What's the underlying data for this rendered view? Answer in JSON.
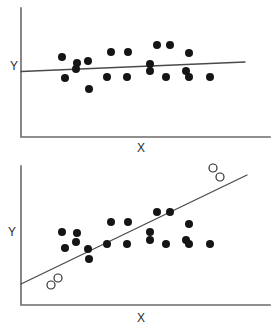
{
  "figure": {
    "background_color": "#ffffff",
    "width": 274,
    "height": 330,
    "point_fill_color": "#151515",
    "point_open_color": "#ffffff",
    "point_outline_color": "#303030",
    "line_color": "#4a4a4a",
    "axis_color": "#6b6b6b"
  },
  "panels": [
    {
      "name": "top-panel",
      "xlabel": "X",
      "ylabel": "Y",
      "axis": {
        "x0": 21,
        "y0": 137,
        "x1": 270,
        "ytop": 8
      },
      "fit_line": {
        "x1": 21,
        "y1": 71.5,
        "x2": 245,
        "y2": 62.0
      },
      "xlabel_pos": {
        "x": 141,
        "y": 152
      },
      "ylabel_pos": {
        "x": 10,
        "y": 70
      }
    },
    {
      "name": "bottom-panel",
      "xlabel": "X",
      "ylabel": "Y",
      "axis": {
        "x0": 21,
        "y0": 305,
        "x1": 270,
        "ytop": 166
      },
      "fit_line": {
        "x1": 21,
        "y1": 284.0,
        "x2": 247,
        "y2": 175.0
      },
      "xlabel_pos": {
        "x": 141,
        "y": 322
      },
      "ylabel_pos": {
        "x": 8,
        "y": 236
      }
    }
  ],
  "chart_data": {
    "type": "scatter",
    "title": "",
    "xlabel": "X",
    "ylabel": "Y",
    "grid": false,
    "legend": false,
    "panel_count": 2,
    "panels": [
      {
        "name": "top-panel",
        "description": "Scatter of 20 filled points with a nearly flat fitted regression line (weak positive slope).",
        "xlim": [
          21,
          270
        ],
        "ylim_pixels": [
          137,
          8
        ],
        "series": [
          {
            "name": "data-points",
            "marker": "filled-circle",
            "marker_size_px": 8,
            "points": [
              [
                62,
                57
              ],
              [
                65,
                78
              ],
              [
                76,
                69
              ],
              [
                77,
                63
              ],
              [
                88,
                61
              ],
              [
                89,
                89
              ],
              [
                111,
                52
              ],
              [
                107,
                77
              ],
              [
                128,
                52
              ],
              [
                127,
                77
              ],
              [
                150,
                71
              ],
              [
                150,
                64
              ],
              [
                157,
                45
              ],
              [
                170,
                45
              ],
              [
                166,
                77
              ],
              [
                186,
                71
              ],
              [
                189,
                53
              ],
              [
                189,
                77
              ],
              [
                210,
                77
              ]
            ]
          }
        ],
        "fit_line": {
          "name": "least-squares-line",
          "start": [
            21,
            71.5
          ],
          "end": [
            245,
            62.0
          ],
          "slope_sign": "slightly positive",
          "interpretation": "no strong relationship"
        }
      },
      {
        "name": "bottom-panel",
        "description": "Identical 20 filled points plus 4 open-circle outliers (2 at lower-left, 2 at upper-right) which inflate the fitted slope into a strong positive trend.",
        "xlim": [
          21,
          270
        ],
        "ylim_pixels": [
          305,
          166
        ],
        "series": [
          {
            "name": "data-points",
            "marker": "filled-circle",
            "marker_size_px": 8,
            "points": [
              [
                62,
                232
              ],
              [
                65,
                248
              ],
              [
                76,
                242
              ],
              [
                77,
                233
              ],
              [
                88,
                249
              ],
              [
                89,
                259
              ],
              [
                111,
                222
              ],
              [
                107,
                244
              ],
              [
                128,
                222
              ],
              [
                127,
                244
              ],
              [
                150,
                240
              ],
              [
                150,
                232
              ],
              [
                157,
                212
              ],
              [
                170,
                212
              ],
              [
                166,
                244
              ],
              [
                186,
                240
              ],
              [
                189,
                224
              ],
              [
                189,
                244
              ],
              [
                210,
                244
              ]
            ]
          },
          {
            "name": "outliers",
            "marker": "open-circle",
            "marker_size_px": 8,
            "points": [
              [
                51,
                285
              ],
              [
                58,
                278
              ],
              [
                213,
                168
              ],
              [
                220,
                177
              ]
            ]
          }
        ],
        "fit_line": {
          "name": "least-squares-line",
          "start": [
            21,
            284.0
          ],
          "end": [
            247,
            175.0
          ],
          "slope_sign": "strongly positive",
          "interpretation": "apparent relationship driven by outliers"
        }
      }
    ]
  }
}
